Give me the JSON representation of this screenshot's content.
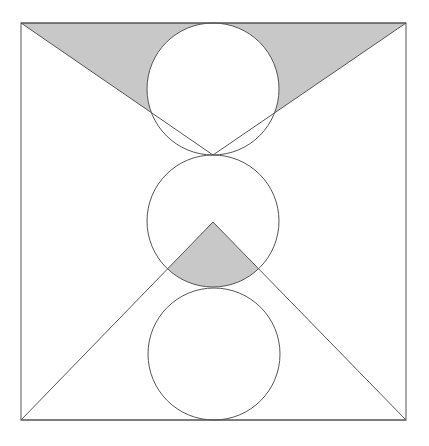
{
  "diagram": {
    "colors": {
      "stroke": "#555555",
      "shade": "#c8c8c8",
      "background": "#ffffff"
    },
    "square": {
      "x": 21,
      "y": 23,
      "width": 385,
      "height": 397
    },
    "circles": [
      {
        "name": "top-circle",
        "cx": 213,
        "cy": 89,
        "r": 66
      },
      {
        "name": "middle-circle",
        "cx": 213,
        "cy": 221,
        "r": 66
      },
      {
        "name": "bottom-circle",
        "cx": 214,
        "cy": 354,
        "r": 66
      }
    ],
    "triangles": [
      {
        "name": "top-inverted-triangle",
        "points": [
          [
            21,
            23
          ],
          [
            406,
            23
          ],
          [
            213,
            155
          ]
        ]
      },
      {
        "name": "bottom-triangle",
        "points": [
          [
            21,
            420
          ],
          [
            406,
            420
          ],
          [
            213,
            222
          ]
        ]
      }
    ]
  }
}
